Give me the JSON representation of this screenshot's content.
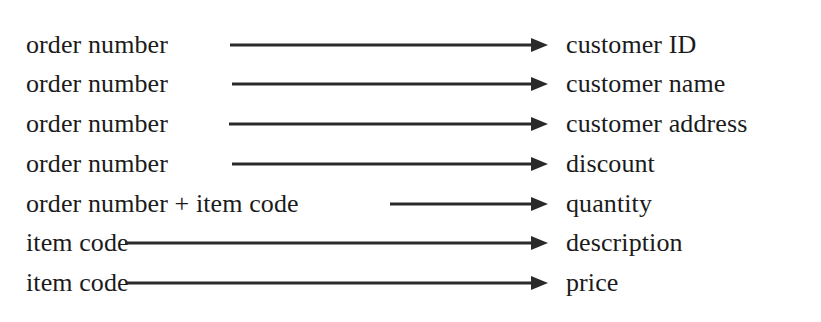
{
  "diagram": {
    "kind": "functional-dependency-diagram",
    "background_color": "#ffffff",
    "ink_color": "#1b1b1b",
    "arrow_color": "#2a2a2a",
    "arrow_tip_x": 548,
    "rows": [
      {
        "determinant": "order number",
        "dependent": "customer ID",
        "arrow_start_x": 230,
        "row_top": 25
      },
      {
        "determinant": "order number",
        "dependent": "customer name",
        "arrow_start_x": 232,
        "row_top": 64
      },
      {
        "determinant": "order number",
        "dependent": "customer address",
        "arrow_start_x": 229,
        "row_top": 104
      },
      {
        "determinant": "order number",
        "dependent": "discount",
        "arrow_start_x": 232,
        "row_top": 144
      },
      {
        "determinant": "order number + item code",
        "dependent": "quantity",
        "arrow_start_x": 390,
        "row_top": 184
      },
      {
        "determinant": "item code",
        "dependent": "description",
        "arrow_start_x": 125,
        "row_top": 223
      },
      {
        "determinant": "item code",
        "dependent": "price",
        "arrow_start_x": 127,
        "row_top": 263
      }
    ]
  }
}
